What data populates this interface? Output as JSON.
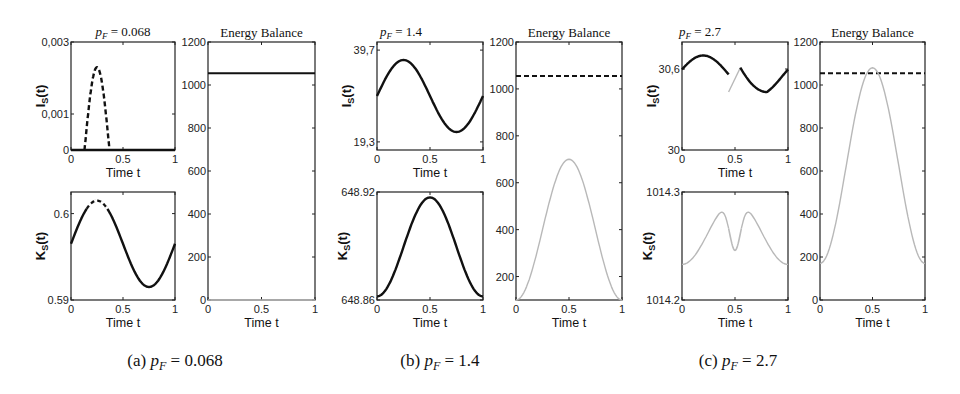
{
  "figure": {
    "captions": [
      "(a) p_F = 0.068",
      "(b) p_F = 1.4",
      "(c) p_F = 2.7"
    ],
    "caption_parts": [
      {
        "label": "(a)",
        "var": "p",
        "sub": "F",
        "value": "= 0.068"
      },
      {
        "label": "(b)",
        "var": "p",
        "sub": "F",
        "value": "= 1.4"
      },
      {
        "label": "(c)",
        "var": "p",
        "sub": "F",
        "value": "= 2.7"
      }
    ],
    "subplot_titles": [
      {
        "var": "p",
        "sub": "F",
        "value": "= 0.068"
      },
      {
        "var": "p",
        "sub": "F",
        "value": "= 1.4"
      },
      {
        "var": "p",
        "sub": "F",
        "value": "= 2.7"
      }
    ],
    "energy_title": "Energy Balance",
    "xlabel": "Time t",
    "ylabel_I": "I_S(t)",
    "ylabel_K": "K_S(t)",
    "xticks": [
      "0",
      "0.5",
      "1"
    ]
  },
  "chart_data": [
    {
      "panel": "a-top",
      "type": "line",
      "title": "p_F = 0.068",
      "xlabel": "Time t",
      "ylabel": "I_S(t)",
      "xlim": [
        0,
        1
      ],
      "ylim": [
        0,
        0.003
      ],
      "yticks": [
        "0",
        "0,001",
        "0,003"
      ],
      "series": [
        {
          "name": "I_S solid",
          "style": "solid",
          "x": [
            0,
            0.13,
            0.37,
            1
          ],
          "y": [
            0,
            0,
            0,
            0
          ]
        },
        {
          "name": "I_S dashed",
          "style": "dashed",
          "x": [
            0.13,
            0.18,
            0.22,
            0.25,
            0.28,
            0.32,
            0.37
          ],
          "y": [
            0,
            0.0012,
            0.0021,
            0.0023,
            0.0021,
            0.0012,
            0
          ]
        }
      ]
    },
    {
      "panel": "a-bottom",
      "type": "line",
      "xlabel": "Time t",
      "ylabel": "K_S(t)",
      "xlim": [
        0,
        1
      ],
      "ylim": [
        0.59,
        0.6025
      ],
      "yticks": [
        "0.59",
        "0.6"
      ],
      "series": [
        {
          "name": "K_S",
          "style": "solid with dashed peak (t 0.15-0.35)",
          "x": [
            0,
            0.25,
            0.5,
            0.75,
            1
          ],
          "y": [
            0.5965,
            0.6015,
            0.5965,
            0.5915,
            0.5965
          ]
        }
      ]
    },
    {
      "panel": "a-energy",
      "type": "line",
      "title": "Energy Balance",
      "xlabel": "Time t",
      "ylabel": "",
      "xlim": [
        0,
        1
      ],
      "ylim": [
        0,
        1200
      ],
      "yticks": [
        "0",
        "200",
        "400",
        "600",
        "800",
        "1000",
        "1200"
      ],
      "series": [
        {
          "name": "threshold",
          "style": "solid black",
          "x": [
            0,
            1
          ],
          "y": [
            1055,
            1055
          ]
        },
        {
          "name": "energy",
          "style": "solid gray",
          "x": [
            0,
            1
          ],
          "y": [
            0,
            0
          ]
        }
      ]
    },
    {
      "panel": "b-top",
      "type": "line",
      "title": "p_F = 1.4",
      "xlabel": "Time t",
      "ylabel": "I_S(t)",
      "xlim": [
        0,
        1
      ],
      "ylim": [
        17.5,
        41.5
      ],
      "yticks": [
        "19,3",
        "39,7"
      ],
      "series": [
        {
          "name": "I_S",
          "style": "solid",
          "x": [
            0,
            0.25,
            0.5,
            0.75,
            1
          ],
          "y": [
            29.5,
            37.5,
            29.5,
            21.5,
            29.5
          ]
        }
      ]
    },
    {
      "panel": "b-bottom",
      "type": "line",
      "xlabel": "Time t",
      "ylabel": "K_S(t)",
      "xlim": [
        0,
        1
      ],
      "ylim": [
        648.86,
        648.92
      ],
      "yticks": [
        "648.86",
        "648.92"
      ],
      "series": [
        {
          "name": "K_S",
          "style": "solid",
          "x": [
            0,
            0.25,
            0.5,
            0.75,
            1
          ],
          "y": [
            648.862,
            648.889,
            648.917,
            648.889,
            648.862
          ]
        }
      ]
    },
    {
      "panel": "b-energy",
      "type": "line",
      "title": "Energy Balance",
      "xlabel": "Time t",
      "ylabel": "",
      "xlim": [
        0,
        1
      ],
      "ylim": [
        100,
        1200
      ],
      "yticks": [
        "200",
        "400",
        "600",
        "800",
        "1000",
        "1200"
      ],
      "series": [
        {
          "name": "threshold",
          "style": "dashed black",
          "x": [
            0,
            1
          ],
          "y": [
            1055,
            1055
          ]
        },
        {
          "name": "energy",
          "style": "solid gray",
          "x": [
            0,
            0.25,
            0.5,
            0.75,
            1
          ],
          "y": [
            100,
            400,
            700,
            400,
            100
          ]
        }
      ]
    },
    {
      "panel": "c-top",
      "type": "line",
      "title": "p_F = 2.7",
      "xlabel": "Time t",
      "ylabel": "I_S(t)",
      "xlim": [
        0,
        1
      ],
      "ylim": [
        30,
        30.8
      ],
      "yticks": [
        "30",
        "30,6"
      ],
      "series": [
        {
          "name": "I_S solid part 1",
          "style": "solid",
          "x": [
            0,
            0.2,
            0.44
          ],
          "y": [
            30.57,
            30.7,
            30.43
          ]
        },
        {
          "name": "I_S gray jump",
          "style": "solid gray",
          "x": [
            0.44,
            0.55
          ],
          "y": [
            30.43,
            30.61
          ]
        },
        {
          "name": "I_S solid part 2",
          "style": "solid",
          "x": [
            0.55,
            0.8,
            1
          ],
          "y": [
            30.61,
            30.42,
            30.57
          ]
        }
      ]
    },
    {
      "panel": "c-bottom",
      "type": "line",
      "xlabel": "Time t",
      "ylabel": "K_S(t)",
      "xlim": [
        0,
        1
      ],
      "ylim": [
        1014.2,
        1014.3
      ],
      "yticks": [
        "1014.2",
        "1014.3"
      ],
      "series": [
        {
          "name": "K_S",
          "style": "solid with gray dip near t=0.5",
          "x": [
            0,
            0.4,
            0.5,
            0.6,
            1
          ],
          "y": [
            1014.233,
            1014.273,
            1014.265,
            1014.273,
            1014.233
          ]
        }
      ]
    },
    {
      "panel": "c-energy",
      "type": "line",
      "title": "Energy Balance",
      "xlabel": "Time t",
      "ylabel": "",
      "xlim": [
        0,
        1
      ],
      "ylim": [
        0,
        1200
      ],
      "yticks": [
        "0",
        "200",
        "400",
        "600",
        "800",
        "1000",
        "1200"
      ],
      "series": [
        {
          "name": "threshold",
          "style": "dashed black",
          "x": [
            0,
            1
          ],
          "y": [
            1055,
            1055
          ]
        },
        {
          "name": "energy",
          "style": "solid gray",
          "x": [
            0,
            0.25,
            0.5,
            0.75,
            1
          ],
          "y": [
            170,
            620,
            1080,
            620,
            170
          ]
        }
      ]
    }
  ]
}
